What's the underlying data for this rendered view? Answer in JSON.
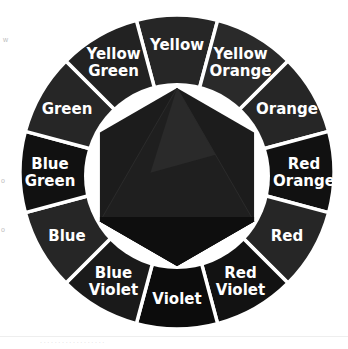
{
  "diagram": {
    "type": "color-wheel",
    "center": [
      177,
      172
    ],
    "outer_radius": 157,
    "inner_ring_radius": 93,
    "hexagon_radius": 89,
    "segment_gap_color": "#ffffff",
    "segments": [
      {
        "label_lines": [
          "Yellow"
        ],
        "fill": "#262626"
      },
      {
        "label_lines": [
          "Yellow",
          "Orange"
        ],
        "fill": "#2a2a2a"
      },
      {
        "label_lines": [
          "Orange"
        ],
        "fill": "#262626"
      },
      {
        "label_lines": [
          "Red",
          "Orange"
        ],
        "fill": "#111111"
      },
      {
        "label_lines": [
          "Red"
        ],
        "fill": "#262626"
      },
      {
        "label_lines": [
          "Red",
          "Violet"
        ],
        "fill": "#121212"
      },
      {
        "label_lines": [
          "Violet"
        ],
        "fill": "#0c0c0c"
      },
      {
        "label_lines": [
          "Blue",
          "Violet"
        ],
        "fill": "#1a1a1a"
      },
      {
        "label_lines": [
          "Blue"
        ],
        "fill": "#262626"
      },
      {
        "label_lines": [
          "Blue",
          "Green"
        ],
        "fill": "#111111"
      },
      {
        "label_lines": [
          "Green"
        ],
        "fill": "#262626"
      },
      {
        "label_lines": [
          "Yellow",
          "Green"
        ],
        "fill": "#222222"
      }
    ],
    "hexagon": {
      "fill": "#1c1c1c",
      "inner_triangle_fill": "#2a2a2a",
      "bottom_band_fill": "#0e0e0e"
    }
  },
  "margin_notes": [
    "w",
    "o",
    "o"
  ],
  "caption": "· · · · · · · · · · · · · · · · · ·"
}
